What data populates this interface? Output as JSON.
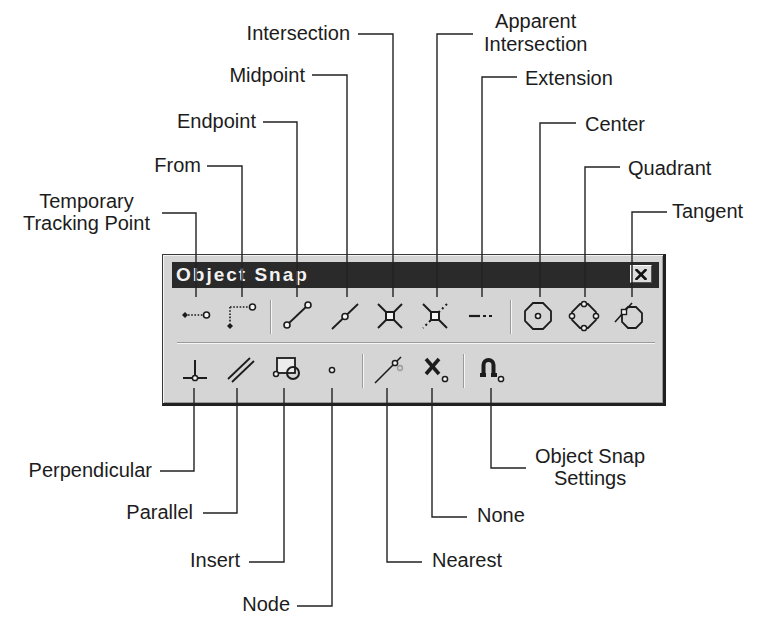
{
  "toolbar": {
    "title": "Object Snap",
    "close_icon": "close-icon",
    "row1": [
      {
        "tool": "Temporary Tracking Point",
        "icon": "temporary-tracking-point-icon"
      },
      {
        "tool": "From",
        "icon": "from-icon"
      },
      {
        "separator": true
      },
      {
        "tool": "Endpoint",
        "icon": "endpoint-icon"
      },
      {
        "tool": "Midpoint",
        "icon": "midpoint-icon"
      },
      {
        "tool": "Intersection",
        "icon": "intersection-icon"
      },
      {
        "tool": "Apparent Intersection",
        "icon": "apparent-intersection-icon"
      },
      {
        "tool": "Extension",
        "icon": "extension-icon"
      },
      {
        "separator": true
      },
      {
        "tool": "Center",
        "icon": "center-icon"
      },
      {
        "tool": "Quadrant",
        "icon": "quadrant-icon"
      },
      {
        "tool": "Tangent",
        "icon": "tangent-icon"
      }
    ],
    "row2": [
      {
        "tool": "Perpendicular",
        "icon": "perpendicular-icon"
      },
      {
        "tool": "Parallel",
        "icon": "parallel-icon"
      },
      {
        "tool": "Insert",
        "icon": "insert-icon"
      },
      {
        "tool": "Node",
        "icon": "node-icon"
      },
      {
        "separator": true
      },
      {
        "tool": "Nearest",
        "icon": "nearest-icon"
      },
      {
        "tool": "None",
        "icon": "none-icon"
      },
      {
        "separator": true
      },
      {
        "tool": "Object Snap Settings",
        "icon": "object-snap-settings-icon"
      }
    ]
  },
  "callouts": {
    "temporary_tracking_point": {
      "lines": [
        "Temporary",
        "Tracking Point"
      ]
    },
    "from": {
      "label": "From"
    },
    "endpoint": {
      "label": "Endpoint"
    },
    "midpoint": {
      "label": "Midpoint"
    },
    "intersection": {
      "label": "Intersection"
    },
    "apparent_intersection": {
      "lines": [
        "Apparent",
        "Intersection"
      ]
    },
    "extension": {
      "label": "Extension"
    },
    "center": {
      "label": "Center"
    },
    "quadrant": {
      "label": "Quadrant"
    },
    "tangent": {
      "label": "Tangent"
    },
    "perpendicular": {
      "label": "Perpendicular"
    },
    "parallel": {
      "label": "Parallel"
    },
    "insert": {
      "label": "Insert"
    },
    "node": {
      "label": "Node"
    },
    "nearest": {
      "label": "Nearest"
    },
    "none": {
      "label": "None"
    },
    "object_snap_settings": {
      "lines": [
        "Object Snap",
        "Settings"
      ]
    }
  },
  "colors": {
    "background": "#ffffff",
    "toolbar_face": "#d5d5d5",
    "titlebar": "#2a2a2a",
    "title_text": "#f2f2f2",
    "ink": "#1c1c1c"
  }
}
